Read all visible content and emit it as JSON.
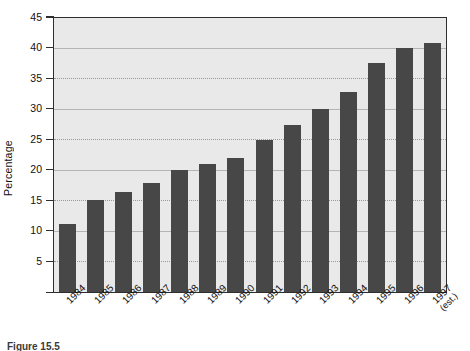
{
  "chart_data": {
    "type": "bar",
    "title": "",
    "xlabel": "",
    "ylabel": "Percentage",
    "ylim": [
      0,
      45
    ],
    "yticks": [
      5,
      10,
      15,
      20,
      25,
      30,
      35,
      40,
      45
    ],
    "grid": true,
    "legend": "none",
    "categories": [
      "1984",
      "1985",
      "1986",
      "1987",
      "1988",
      "1989",
      "1990",
      "1991",
      "1992",
      "1993",
      "1994",
      "1995",
      "1996",
      "1997"
    ],
    "category_labels": [
      {
        "line1": "1984",
        "line2": ""
      },
      {
        "line1": "1985",
        "line2": ""
      },
      {
        "line1": "1986",
        "line2": ""
      },
      {
        "line1": "1987",
        "line2": ""
      },
      {
        "line1": "1988",
        "line2": ""
      },
      {
        "line1": "1989",
        "line2": ""
      },
      {
        "line1": "1990",
        "line2": ""
      },
      {
        "line1": "1991",
        "line2": ""
      },
      {
        "line1": "1992",
        "line2": ""
      },
      {
        "line1": "1993",
        "line2": ""
      },
      {
        "line1": "1994",
        "line2": ""
      },
      {
        "line1": "1995",
        "line2": ""
      },
      {
        "line1": "1996",
        "line2": ""
      },
      {
        "line1": "1997",
        "line2": "(est.)"
      }
    ],
    "values": [
      11.2,
      15.0,
      16.3,
      17.9,
      20.0,
      20.9,
      21.9,
      24.9,
      27.3,
      30.0,
      32.8,
      37.5,
      39.9,
      40.8
    ],
    "bar_color": "#474747",
    "plot_background": "#e9e9e9",
    "gridline_color": "#9a9a9a",
    "axis_color": "#2e2e2e"
  },
  "figure": {
    "caption": "Figure 15.5"
  }
}
